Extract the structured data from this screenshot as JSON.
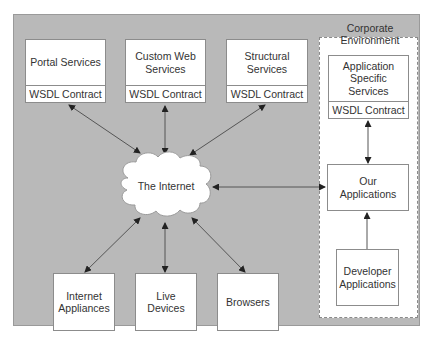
{
  "diagram": {
    "corporate_environment": {
      "label": "Corporate Environment"
    },
    "internet": {
      "label": "The Internet"
    },
    "services": [
      {
        "label": "Portal Services",
        "contract": "WSDL Contract"
      },
      {
        "label": "Custom Web Services",
        "contract": "WSDL Contract"
      },
      {
        "label": "Structural Services",
        "contract": "WSDL Contract"
      }
    ],
    "corporate": {
      "app_specific": {
        "label": "Application Specific Services",
        "contract": "WSDL Contract"
      },
      "our_apps": {
        "label": "Our Applications"
      },
      "developer_apps": {
        "label": "Developer Applications"
      }
    },
    "clients": [
      {
        "label": "Internet Appliances"
      },
      {
        "label": "Live Devices"
      },
      {
        "label": "Browsers"
      }
    ],
    "colors": {
      "panel": "#b9b9b9",
      "box": "#ffffff",
      "line": "#555555"
    }
  }
}
